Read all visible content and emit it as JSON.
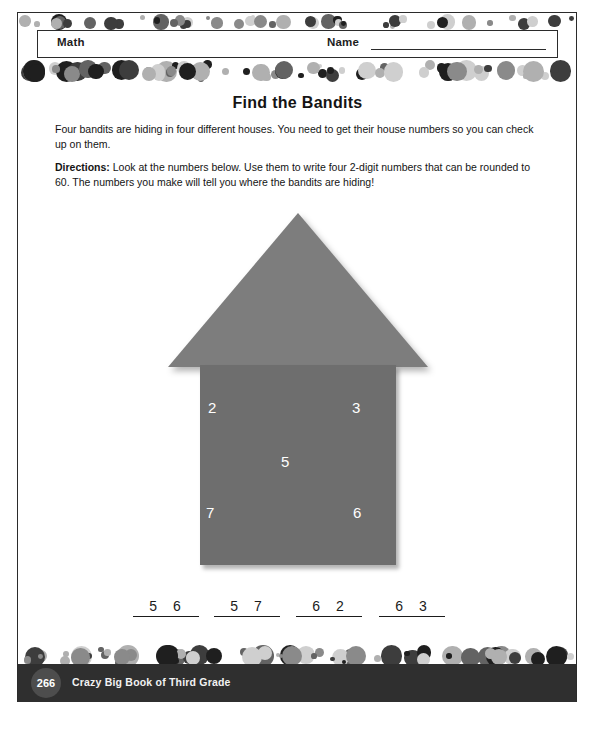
{
  "header": {
    "subject": "Math",
    "name_label": "Name"
  },
  "title": "Find the Bandits",
  "intro": "Four bandits are hiding in four different houses. You need to get their house numbers so you can check up on them.",
  "directions_label": "Directions:",
  "directions_text": " Look at the numbers below. Use them to write four 2-digit numbers that can be rounded to 60. The numbers you make will tell you where the bandits are hiding!",
  "house": {
    "numbers": [
      "2",
      "3",
      "5",
      "7",
      "6"
    ]
  },
  "answers": [
    "5 6",
    "5 7",
    "6 2",
    "6 3"
  ],
  "footer": {
    "page_number": "266",
    "book_title": "Crazy Big Book of Third Grade"
  },
  "bottom_caption": "",
  "colors": {
    "roof": "#7d7d7d",
    "body": "#6e6e6e",
    "footer_bar": "#2f2f2f",
    "badge": "#4d4d4d"
  },
  "dot_band_colors": [
    "#1f1f1f",
    "#3d3d3d",
    "#636363",
    "#8a8a8a",
    "#b0b0b0",
    "#cfcfcf"
  ]
}
